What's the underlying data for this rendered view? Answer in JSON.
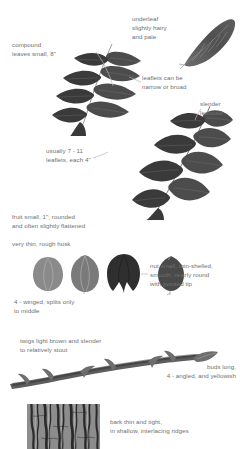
{
  "figure": {
    "background_color": "#ffffff",
    "text_color": "#6f6f6f"
  },
  "captions": {
    "underleaf": "underleaf\nslightly hairy\nand pale",
    "compound_leaves": "compound\nleaves small, 8\"",
    "leaflets_shape": "leaflets can be\nnarrow or broad",
    "slender_leafstalk": "slender\nleafstalk",
    "leaflet_count": "usually 7 - 11\nleaflets, each 4\"",
    "fruit": "fruit small, 1\"; rounded\nand often slightly flattened",
    "husk": "very thin, rough husk",
    "nut": "nut small, thin-shelled,\nsmooth; nearly round\nwith pointed tip",
    "winged": "4 - winged, splits only\nto middle",
    "twigs": "twigs light brown and slender\nto relatively stout",
    "buds": "buds long,\n4 - angled, and yellowish",
    "bark": "bark thin and tight,\nin shallow, interlacing ridges"
  },
  "illustrations": {
    "underleaf_leaflet": "single-leaflet-underside",
    "compound_leaf_upper": "compound-leaf-narrow-leaflets",
    "compound_leaf_lower": "compound-leaf-broad-leaflets",
    "fruit_husk_light": "fruit-husk-intact-light",
    "fruit_husk_medium": "fruit-husk-intact-medium",
    "fruit_husk_split": "fruit-husk-split-4-winged",
    "nut_shelled": "nut-pointed-tip",
    "twig_with_buds": "twig-lateral-with-terminal-bud",
    "bark_texture": "bark-interlacing-ridges"
  }
}
